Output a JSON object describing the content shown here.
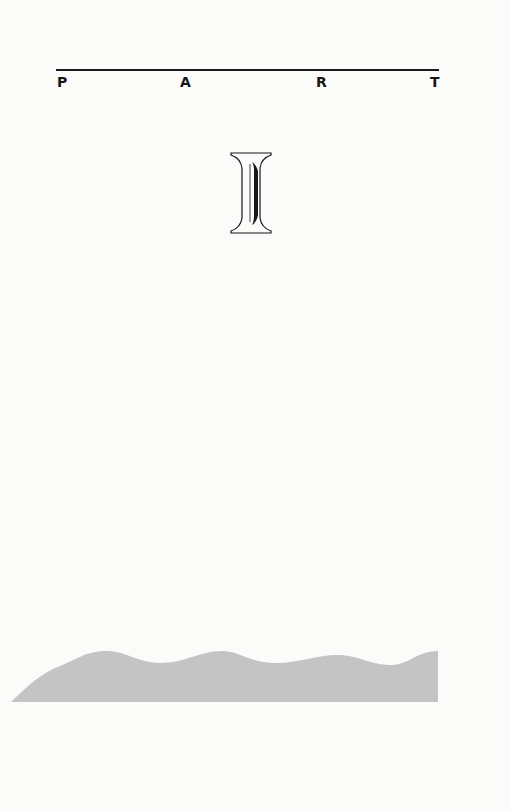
{
  "header": {
    "letters": [
      "P",
      "A",
      "R",
      "T"
    ]
  },
  "part_number": "I",
  "colors": {
    "text": "#161616",
    "rule": "#1a1a1a",
    "wave_fill": "#c4c4c4",
    "background": "#fbfbfa"
  }
}
